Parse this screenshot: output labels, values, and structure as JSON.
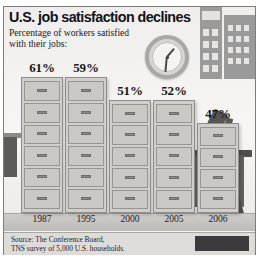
{
  "headline": {
    "title": "U.S. job satisfaction declines",
    "subtitle": "Percentage of workers satisfied with their jobs:"
  },
  "source": {
    "line1": "Source: The Conference Board,",
    "line2": "TNS survey of 5,000 U.S. households."
  },
  "credit": {
    "text": ""
  },
  "icons": {
    "clock": "wall-clock-icon",
    "buildings": "office-buildings-icon",
    "desk": "desk-icon",
    "lamp": "desk-lamp-icon",
    "person": "person-legs-icon"
  },
  "colors": {
    "cabinet_body": "#cfcecb",
    "cabinet_outline": "#8d8c89",
    "panel_bg": "#f4f3f1",
    "source_bg": "#dedcd9",
    "floor": "#cfcdc9",
    "text": "#16161a"
  },
  "chart_data": {
    "type": "bar",
    "title": "U.S. job satisfaction declines",
    "subtitle": "Percentage of workers satisfied with their jobs:",
    "xlabel": "",
    "ylabel": "",
    "ylim": [
      0,
      65
    ],
    "grid": false,
    "legend": "none",
    "categories": [
      "1987",
      "1995",
      "2000",
      "2005",
      "2006"
    ],
    "values": [
      61,
      59,
      51,
      52,
      47
    ],
    "value_labels": [
      "61%",
      "59%",
      "51%",
      "52%",
      "47%"
    ],
    "bar_style": "filing-cabinet",
    "drawers": [
      6,
      6,
      5,
      5,
      4
    ],
    "source": "Source: The Conference Board, TNS survey of 5,000 U.S. households."
  }
}
